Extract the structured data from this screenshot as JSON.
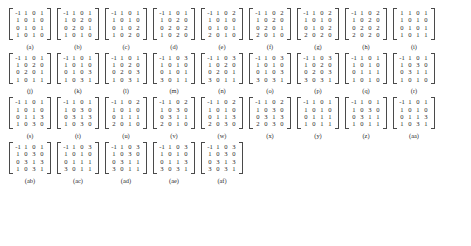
{
  "figure": {
    "type": "matrix-grid",
    "columns_per_row": 9,
    "matrix_size": "4x4",
    "matrices": [
      {
        "label": "(a)",
        "rows": [
          [
            "-1",
            "1",
            "0",
            "1"
          ],
          [
            "1",
            "0",
            "1",
            "0"
          ],
          [
            "0",
            "1",
            "0",
            "1"
          ],
          [
            "1",
            "0",
            "1",
            "0"
          ]
        ]
      },
      {
        "label": "(b)",
        "rows": [
          [
            "-1",
            "1",
            "0",
            "1"
          ],
          [
            "1",
            "0",
            "2",
            "0"
          ],
          [
            "0",
            "2",
            "0",
            "1"
          ],
          [
            "1",
            "0",
            "1",
            "0"
          ]
        ]
      },
      {
        "label": "(c)",
        "rows": [
          [
            "-1",
            "1",
            "0",
            "1"
          ],
          [
            "1",
            "0",
            "1",
            "0"
          ],
          [
            "0",
            "1",
            "0",
            "2"
          ],
          [
            "1",
            "0",
            "2",
            "0"
          ]
        ]
      },
      {
        "label": "(d)",
        "rows": [
          [
            "-1",
            "1",
            "0",
            "1"
          ],
          [
            "1",
            "0",
            "2",
            "0"
          ],
          [
            "0",
            "2",
            "0",
            "2"
          ],
          [
            "1",
            "0",
            "2",
            "0"
          ]
        ]
      },
      {
        "label": "(e)",
        "rows": [
          [
            "-1",
            "1",
            "0",
            "2"
          ],
          [
            "1",
            "0",
            "1",
            "0"
          ],
          [
            "0",
            "1",
            "0",
            "1"
          ],
          [
            "2",
            "0",
            "1",
            "0"
          ]
        ]
      },
      {
        "label": "(f)",
        "rows": [
          [
            "-1",
            "1",
            "0",
            "2"
          ],
          [
            "1",
            "0",
            "2",
            "0"
          ],
          [
            "0",
            "2",
            "0",
            "1"
          ],
          [
            "2",
            "0",
            "1",
            "0"
          ]
        ]
      },
      {
        "label": "(g)",
        "rows": [
          [
            "-1",
            "1",
            "0",
            "2"
          ],
          [
            "1",
            "0",
            "1",
            "0"
          ],
          [
            "0",
            "1",
            "0",
            "2"
          ],
          [
            "2",
            "0",
            "2",
            "0"
          ]
        ]
      },
      {
        "label": "(h)",
        "rows": [
          [
            "-1",
            "1",
            "0",
            "2"
          ],
          [
            "1",
            "0",
            "2",
            "0"
          ],
          [
            "0",
            "2",
            "0",
            "2"
          ],
          [
            "2",
            "0",
            "2",
            "0"
          ]
        ]
      },
      {
        "label": "(i)",
        "rows": [
          [
            "1",
            "1",
            "0",
            "1"
          ],
          [
            "1",
            "0",
            "1",
            "0"
          ],
          [
            "0",
            "1",
            "0",
            "1"
          ],
          [
            "1",
            "0",
            "1",
            "1"
          ]
        ]
      },
      {
        "label": "(j)",
        "rows": [
          [
            "-1",
            "1",
            "0",
            "1"
          ],
          [
            "1",
            "0",
            "2",
            "0"
          ],
          [
            "0",
            "2",
            "0",
            "1"
          ],
          [
            "1",
            "0",
            "1",
            "1"
          ]
        ]
      },
      {
        "label": "(k)",
        "rows": [
          [
            "-1",
            "1",
            "0",
            "1"
          ],
          [
            "1",
            "0",
            "1",
            "0"
          ],
          [
            "0",
            "1",
            "0",
            "3"
          ],
          [
            "1",
            "0",
            "3",
            "1"
          ]
        ]
      },
      {
        "label": "(l)",
        "rows": [
          [
            "-1",
            "1",
            "0",
            "1"
          ],
          [
            "1",
            "0",
            "2",
            "0"
          ],
          [
            "0",
            "2",
            "0",
            "3"
          ],
          [
            "1",
            "0",
            "3",
            "1"
          ]
        ]
      },
      {
        "label": "(m)",
        "rows": [
          [
            "-1",
            "1",
            "0",
            "3"
          ],
          [
            "1",
            "0",
            "1",
            "0"
          ],
          [
            "0",
            "1",
            "0",
            "1"
          ],
          [
            "3",
            "0",
            "1",
            "1"
          ]
        ]
      },
      {
        "label": "(n)",
        "rows": [
          [
            "-1",
            "1",
            "0",
            "3"
          ],
          [
            "1",
            "0",
            "2",
            "0"
          ],
          [
            "0",
            "2",
            "0",
            "1"
          ],
          [
            "3",
            "0",
            "1",
            "1"
          ]
        ]
      },
      {
        "label": "(o)",
        "rows": [
          [
            "-1",
            "1",
            "0",
            "3"
          ],
          [
            "1",
            "0",
            "1",
            "0"
          ],
          [
            "0",
            "1",
            "0",
            "3"
          ],
          [
            "3",
            "0",
            "3",
            "1"
          ]
        ]
      },
      {
        "label": "(p)",
        "rows": [
          [
            "-1",
            "1",
            "0",
            "3"
          ],
          [
            "1",
            "0",
            "2",
            "0"
          ],
          [
            "0",
            "2",
            "0",
            "3"
          ],
          [
            "3",
            "0",
            "3",
            "1"
          ]
        ]
      },
      {
        "label": "(q)",
        "rows": [
          [
            "-1",
            "1",
            "0",
            "1"
          ],
          [
            "1",
            "0",
            "1",
            "0"
          ],
          [
            "0",
            "1",
            "1",
            "1"
          ],
          [
            "1",
            "0",
            "1",
            "0"
          ]
        ]
      },
      {
        "label": "(r)",
        "rows": [
          [
            "-1",
            "1",
            "0",
            "1"
          ],
          [
            "1",
            "0",
            "3",
            "0"
          ],
          [
            "0",
            "3",
            "1",
            "1"
          ],
          [
            "1",
            "0",
            "1",
            "0"
          ]
        ]
      },
      {
        "label": "(s)",
        "rows": [
          [
            "-1",
            "1",
            "0",
            "1"
          ],
          [
            "1",
            "0",
            "1",
            "0"
          ],
          [
            "0",
            "1",
            "1",
            "3"
          ],
          [
            "1",
            "0",
            "3",
            "0"
          ]
        ]
      },
      {
        "label": "(t)",
        "rows": [
          [
            "-1",
            "1",
            "0",
            "1"
          ],
          [
            "1",
            "0",
            "3",
            "0"
          ],
          [
            "0",
            "3",
            "1",
            "3"
          ],
          [
            "1",
            "0",
            "3",
            "0"
          ]
        ]
      },
      {
        "label": "(u)",
        "rows": [
          [
            "-1",
            "1",
            "0",
            "2"
          ],
          [
            "1",
            "0",
            "1",
            "0"
          ],
          [
            "0",
            "1",
            "1",
            "1"
          ],
          [
            "2",
            "0",
            "1",
            "0"
          ]
        ]
      },
      {
        "label": "(v)",
        "rows": [
          [
            "-1",
            "1",
            "0",
            "2"
          ],
          [
            "1",
            "0",
            "3",
            "0"
          ],
          [
            "0",
            "3",
            "1",
            "1"
          ],
          [
            "2",
            "0",
            "1",
            "0"
          ]
        ]
      },
      {
        "label": "(w)",
        "rows": [
          [
            "-1",
            "1",
            "0",
            "2"
          ],
          [
            "1",
            "0",
            "1",
            "0"
          ],
          [
            "0",
            "1",
            "1",
            "3"
          ],
          [
            "2",
            "0",
            "3",
            "0"
          ]
        ]
      },
      {
        "label": "(x)",
        "rows": [
          [
            "-1",
            "1",
            "0",
            "2"
          ],
          [
            "1",
            "0",
            "3",
            "0"
          ],
          [
            "0",
            "3",
            "1",
            "3"
          ],
          [
            "2",
            "0",
            "3",
            "0"
          ]
        ]
      },
      {
        "label": "(y)",
        "rows": [
          [
            "-1",
            "1",
            "0",
            "1"
          ],
          [
            "1",
            "0",
            "1",
            "0"
          ],
          [
            "0",
            "1",
            "1",
            "1"
          ],
          [
            "1",
            "0",
            "1",
            "1"
          ]
        ]
      },
      {
        "label": "(z)",
        "rows": [
          [
            "-1",
            "1",
            "0",
            "1"
          ],
          [
            "1",
            "0",
            "3",
            "0"
          ],
          [
            "0",
            "3",
            "1",
            "1"
          ],
          [
            "1",
            "0",
            "1",
            "1"
          ]
        ]
      },
      {
        "label": "(aa)",
        "rows": [
          [
            "-1",
            "1",
            "0",
            "1"
          ],
          [
            "1",
            "0",
            "1",
            "0"
          ],
          [
            "0",
            "1",
            "1",
            "3"
          ],
          [
            "1",
            "0",
            "3",
            "1"
          ]
        ]
      },
      {
        "label": "(ab)",
        "rows": [
          [
            "-1",
            "1",
            "0",
            "1"
          ],
          [
            "1",
            "0",
            "3",
            "0"
          ],
          [
            "0",
            "3",
            "1",
            "3"
          ],
          [
            "1",
            "0",
            "3",
            "1"
          ]
        ]
      },
      {
        "label": "(ac)",
        "rows": [
          [
            "-1",
            "1",
            "0",
            "3"
          ],
          [
            "1",
            "0",
            "1",
            "0"
          ],
          [
            "0",
            "1",
            "1",
            "1"
          ],
          [
            "3",
            "0",
            "1",
            "1"
          ]
        ]
      },
      {
        "label": "(ad)",
        "rows": [
          [
            "-1",
            "1",
            "0",
            "3"
          ],
          [
            "1",
            "0",
            "3",
            "0"
          ],
          [
            "0",
            "3",
            "1",
            "1"
          ],
          [
            "3",
            "0",
            "1",
            "1"
          ]
        ]
      },
      {
        "label": "(ae)",
        "rows": [
          [
            "-1",
            "1",
            "0",
            "3"
          ],
          [
            "1",
            "0",
            "1",
            "0"
          ],
          [
            "0",
            "1",
            "1",
            "3"
          ],
          [
            "3",
            "0",
            "3",
            "1"
          ]
        ]
      },
      {
        "label": "(af)",
        "rows": [
          [
            "-1",
            "1",
            "0",
            "3"
          ],
          [
            "1",
            "0",
            "3",
            "0"
          ],
          [
            "0",
            "3",
            "1",
            "3"
          ],
          [
            "3",
            "0",
            "3",
            "1"
          ]
        ]
      }
    ]
  }
}
